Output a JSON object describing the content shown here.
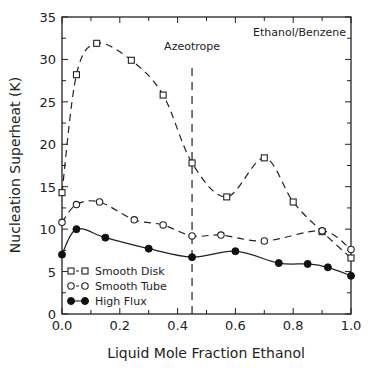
{
  "chart_data": {
    "type": "line",
    "title": "",
    "xlabel": "Liquid Mole Fraction Ethanol",
    "ylabel": "Nucleation Superheat (K)",
    "xlim": [
      0.0,
      1.0
    ],
    "ylim": [
      0,
      35
    ],
    "xticks": [
      "0.0",
      "0.2",
      "0.4",
      "0.6",
      "0.8",
      "1.0"
    ],
    "yticks": [
      "0",
      "5",
      "10",
      "15",
      "20",
      "25",
      "30",
      "35"
    ],
    "grid": false,
    "legend_position": "lower left",
    "annotations": [
      {
        "text": "Ethanol/Benzene",
        "position": "top right"
      },
      {
        "text": "Azeotrope",
        "x": 0.45,
        "style": "vertical dashed line"
      }
    ],
    "series": [
      {
        "name": "Smooth Disk",
        "marker": "square-open",
        "line": "dashed",
        "x": [
          0.0,
          0.05,
          0.12,
          0.24,
          0.35,
          0.45,
          0.57,
          0.7,
          0.8,
          0.9,
          1.0
        ],
        "y": [
          14.3,
          28.2,
          31.9,
          29.9,
          25.8,
          17.8,
          13.8,
          18.4,
          13.2,
          9.7,
          6.6
        ]
      },
      {
        "name": "Smooth Tube",
        "marker": "circle-open",
        "line": "dashed",
        "x": [
          0.0,
          0.05,
          0.13,
          0.25,
          0.35,
          0.45,
          0.55,
          0.7,
          0.9,
          1.0
        ],
        "y": [
          10.8,
          12.9,
          13.2,
          11.1,
          10.5,
          9.2,
          9.3,
          8.6,
          9.8,
          7.6
        ]
      },
      {
        "name": "High Flux",
        "marker": "circle-filled",
        "line": "solid",
        "x": [
          0.0,
          0.05,
          0.15,
          0.3,
          0.45,
          0.6,
          0.75,
          0.85,
          0.92,
          1.0
        ],
        "y": [
          7.0,
          10.0,
          9.0,
          7.7,
          6.7,
          7.4,
          6.0,
          5.9,
          5.5,
          4.5
        ]
      }
    ]
  }
}
